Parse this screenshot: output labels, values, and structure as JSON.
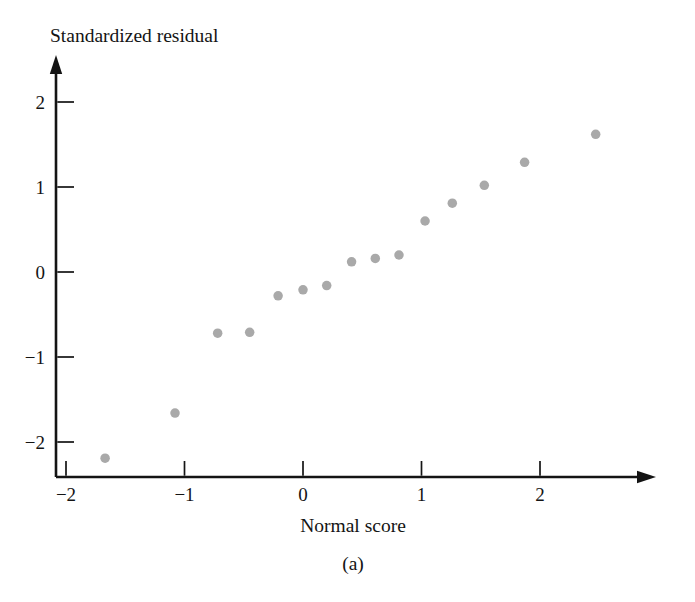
{
  "chart_data": {
    "type": "scatter",
    "title": "",
    "subtitle": "",
    "caption": "(a)",
    "xlabel": "Normal score",
    "ylabel": "Standardized residual",
    "xlim": [
      -2.25,
      2.9
    ],
    "ylim": [
      -2.45,
      2.45
    ],
    "xticks": [
      -2,
      -1,
      0,
      1,
      2
    ],
    "xtick_labels": [
      "−2",
      "−1",
      "0",
      "1",
      "2"
    ],
    "yticks": [
      -2,
      -1,
      0,
      1,
      2
    ],
    "ytick_labels": [
      "−2",
      "−1",
      "0",
      "1",
      "2"
    ],
    "grid": false,
    "legend": null,
    "marker": {
      "shape": "circle",
      "color": "#a9a9a9",
      "size_px": 9.5
    },
    "axis_style": {
      "arrows": true,
      "tick_direction": "inward",
      "spines": [
        "left",
        "bottom"
      ],
      "color": "#141414"
    },
    "n_points": 15,
    "x": [
      -1.67,
      -1.08,
      -0.72,
      -0.45,
      -0.21,
      0.0,
      0.2,
      0.41,
      0.61,
      0.81,
      1.03,
      1.26,
      1.53,
      1.87,
      2.47
    ],
    "y": [
      -2.19,
      -1.66,
      -0.72,
      -0.71,
      -0.28,
      -0.21,
      -0.16,
      0.12,
      0.16,
      0.2,
      0.6,
      0.81,
      1.02,
      1.29,
      1.62
    ],
    "points": [
      {
        "x": -1.67,
        "y": -2.19
      },
      {
        "x": -1.08,
        "y": -1.66
      },
      {
        "x": -0.72,
        "y": -0.72
      },
      {
        "x": -0.45,
        "y": -0.71
      },
      {
        "x": -0.21,
        "y": -0.28
      },
      {
        "x": 0.0,
        "y": -0.21
      },
      {
        "x": 0.2,
        "y": -0.16
      },
      {
        "x": 0.41,
        "y": 0.12
      },
      {
        "x": 0.61,
        "y": 0.16
      },
      {
        "x": 0.81,
        "y": 0.2
      },
      {
        "x": 1.03,
        "y": 0.6
      },
      {
        "x": 1.26,
        "y": 0.81
      },
      {
        "x": 1.53,
        "y": 1.02
      },
      {
        "x": 1.87,
        "y": 1.29
      },
      {
        "x": 2.47,
        "y": 1.62
      }
    ]
  }
}
